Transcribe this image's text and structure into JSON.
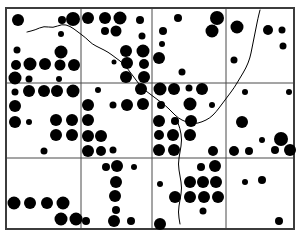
{
  "figure": {
    "width": 302,
    "height": 236,
    "background_color": "#ffffff",
    "ink_color": "#000000"
  },
  "chart_data": {
    "type": "scatter",
    "title": "",
    "subtitle": "",
    "xlabel": "",
    "ylabel": "",
    "xlim": [
      6,
      294
    ],
    "ylim": [
      8,
      229
    ],
    "grid": true,
    "legend": null,
    "marker_shape": "filled-circle",
    "marker_color": "#000000",
    "size_encoding": "marker radius encodes magnitude; radii range approximately 1.5 to 7 px",
    "grid_lines": {
      "vertical_x": [
        6,
        81,
        152,
        226,
        294
      ],
      "horizontal_y": [
        8,
        83,
        158,
        229
      ],
      "columns": 4,
      "rows": 3,
      "line_color": "#4a4a4a",
      "line_width": 1
    },
    "border": {
      "x": 6,
      "y": 8,
      "width": 288,
      "height": 221,
      "color": "#3c3c3c",
      "width_px": 2
    },
    "boundary_line": {
      "name": "river-boundary",
      "color": "#000000",
      "width": 1,
      "points": [
        [
          27,
          32
        ],
        [
          35,
          30
        ],
        [
          44,
          26
        ],
        [
          53,
          28
        ],
        [
          62,
          24
        ],
        [
          70,
          26
        ],
        [
          78,
          32
        ],
        [
          86,
          38
        ],
        [
          92,
          44
        ],
        [
          100,
          48
        ],
        [
          108,
          52
        ],
        [
          116,
          58
        ],
        [
          124,
          64
        ],
        [
          130,
          72
        ],
        [
          136,
          80
        ],
        [
          142,
          88
        ],
        [
          150,
          94
        ],
        [
          158,
          100
        ],
        [
          166,
          106
        ],
        [
          172,
          112
        ],
        [
          178,
          118
        ],
        [
          186,
          122
        ],
        [
          194,
          124
        ],
        [
          202,
          122
        ],
        [
          210,
          118
        ],
        [
          216,
          112
        ],
        [
          222,
          104
        ],
        [
          228,
          96
        ],
        [
          234,
          88
        ],
        [
          240,
          78
        ],
        [
          246,
          68
        ],
        [
          250,
          58
        ],
        [
          252,
          48
        ],
        [
          254,
          38
        ],
        [
          256,
          28
        ],
        [
          258,
          18
        ],
        [
          260,
          10
        ]
      ],
      "branch_points": [
        [
          176,
          118
        ],
        [
          180,
          128
        ],
        [
          182,
          140
        ],
        [
          180,
          152
        ],
        [
          178,
          164
        ],
        [
          180,
          176
        ],
        [
          182,
          188
        ],
        [
          180,
          200
        ],
        [
          178,
          212
        ],
        [
          180,
          224
        ]
      ]
    },
    "points": [
      {
        "x": 18,
        "y": 20,
        "r": 6
      },
      {
        "x": 62,
        "y": 20,
        "r": 4
      },
      {
        "x": 73,
        "y": 19,
        "r": 7
      },
      {
        "x": 61,
        "y": 34,
        "r": 3
      },
      {
        "x": 17,
        "y": 50,
        "r": 3.5
      },
      {
        "x": 61,
        "y": 52,
        "r": 6.5
      },
      {
        "x": 16,
        "y": 65,
        "r": 5
      },
      {
        "x": 30,
        "y": 64,
        "r": 6.5
      },
      {
        "x": 45,
        "y": 64,
        "r": 6
      },
      {
        "x": 60,
        "y": 65,
        "r": 5.5
      },
      {
        "x": 74,
        "y": 65,
        "r": 6
      },
      {
        "x": 15,
        "y": 78,
        "r": 6.5
      },
      {
        "x": 29,
        "y": 79,
        "r": 3.5
      },
      {
        "x": 59,
        "y": 79,
        "r": 3
      },
      {
        "x": 88,
        "y": 18,
        "r": 6
      },
      {
        "x": 105,
        "y": 18,
        "r": 6
      },
      {
        "x": 120,
        "y": 18,
        "r": 6.5
      },
      {
        "x": 105,
        "y": 31,
        "r": 4
      },
      {
        "x": 116,
        "y": 31,
        "r": 5.5
      },
      {
        "x": 140,
        "y": 20,
        "r": 4
      },
      {
        "x": 142,
        "y": 36,
        "r": 3.5
      },
      {
        "x": 126,
        "y": 51,
        "r": 6
      },
      {
        "x": 143,
        "y": 51,
        "r": 6.5
      },
      {
        "x": 114,
        "y": 62,
        "r": 2.5
      },
      {
        "x": 127,
        "y": 63,
        "r": 6
      },
      {
        "x": 144,
        "y": 64,
        "r": 5
      },
      {
        "x": 126,
        "y": 77,
        "r": 6
      },
      {
        "x": 144,
        "y": 77,
        "r": 6
      },
      {
        "x": 178,
        "y": 18,
        "r": 4
      },
      {
        "x": 217,
        "y": 18,
        "r": 7
      },
      {
        "x": 163,
        "y": 31,
        "r": 4
      },
      {
        "x": 212,
        "y": 31,
        "r": 6.5
      },
      {
        "x": 162,
        "y": 44,
        "r": 3
      },
      {
        "x": 159,
        "y": 58,
        "r": 6
      },
      {
        "x": 182,
        "y": 72,
        "r": 3.5
      },
      {
        "x": 237,
        "y": 27,
        "r": 6.5
      },
      {
        "x": 268,
        "y": 30,
        "r": 5
      },
      {
        "x": 282,
        "y": 30,
        "r": 3.5
      },
      {
        "x": 283,
        "y": 46,
        "r": 3.5
      },
      {
        "x": 234,
        "y": 60,
        "r": 3.5
      },
      {
        "x": 15,
        "y": 92,
        "r": 3.5
      },
      {
        "x": 29,
        "y": 91,
        "r": 6
      },
      {
        "x": 44,
        "y": 91,
        "r": 6
      },
      {
        "x": 57,
        "y": 91,
        "r": 6
      },
      {
        "x": 73,
        "y": 91,
        "r": 6.5
      },
      {
        "x": 15,
        "y": 106,
        "r": 6
      },
      {
        "x": 15,
        "y": 122,
        "r": 6
      },
      {
        "x": 29,
        "y": 122,
        "r": 3
      },
      {
        "x": 56,
        "y": 120,
        "r": 6
      },
      {
        "x": 72,
        "y": 120,
        "r": 6
      },
      {
        "x": 56,
        "y": 135,
        "r": 6
      },
      {
        "x": 72,
        "y": 135,
        "r": 6
      },
      {
        "x": 44,
        "y": 151,
        "r": 3.5
      },
      {
        "x": 98,
        "y": 90,
        "r": 3
      },
      {
        "x": 141,
        "y": 89,
        "r": 6
      },
      {
        "x": 88,
        "y": 105,
        "r": 6
      },
      {
        "x": 113,
        "y": 105,
        "r": 3.5
      },
      {
        "x": 127,
        "y": 105,
        "r": 6
      },
      {
        "x": 143,
        "y": 104,
        "r": 6
      },
      {
        "x": 88,
        "y": 120,
        "r": 6
      },
      {
        "x": 88,
        "y": 136,
        "r": 6
      },
      {
        "x": 101,
        "y": 136,
        "r": 6
      },
      {
        "x": 88,
        "y": 151,
        "r": 6
      },
      {
        "x": 101,
        "y": 151,
        "r": 5
      },
      {
        "x": 113,
        "y": 150,
        "r": 3.5
      },
      {
        "x": 160,
        "y": 89,
        "r": 6.5
      },
      {
        "x": 174,
        "y": 89,
        "r": 6
      },
      {
        "x": 189,
        "y": 88,
        "r": 3.5
      },
      {
        "x": 202,
        "y": 89,
        "r": 6
      },
      {
        "x": 161,
        "y": 105,
        "r": 4
      },
      {
        "x": 190,
        "y": 104,
        "r": 6.5
      },
      {
        "x": 212,
        "y": 105,
        "r": 3
      },
      {
        "x": 159,
        "y": 121,
        "r": 6
      },
      {
        "x": 175,
        "y": 121,
        "r": 4
      },
      {
        "x": 191,
        "y": 121,
        "r": 6
      },
      {
        "x": 159,
        "y": 135,
        "r": 5
      },
      {
        "x": 173,
        "y": 135,
        "r": 6
      },
      {
        "x": 190,
        "y": 135,
        "r": 6
      },
      {
        "x": 159,
        "y": 150,
        "r": 6
      },
      {
        "x": 174,
        "y": 150,
        "r": 6
      },
      {
        "x": 213,
        "y": 151,
        "r": 5
      },
      {
        "x": 245,
        "y": 92,
        "r": 3
      },
      {
        "x": 289,
        "y": 92,
        "r": 3
      },
      {
        "x": 242,
        "y": 122,
        "r": 6
      },
      {
        "x": 281,
        "y": 139,
        "r": 7
      },
      {
        "x": 262,
        "y": 140,
        "r": 3
      },
      {
        "x": 234,
        "y": 151,
        "r": 5
      },
      {
        "x": 249,
        "y": 151,
        "r": 4
      },
      {
        "x": 275,
        "y": 150,
        "r": 4
      },
      {
        "x": 290,
        "y": 150,
        "r": 6
      },
      {
        "x": 14,
        "y": 203,
        "r": 6.5
      },
      {
        "x": 30,
        "y": 203,
        "r": 6
      },
      {
        "x": 47,
        "y": 203,
        "r": 6
      },
      {
        "x": 63,
        "y": 203,
        "r": 6.5
      },
      {
        "x": 61,
        "y": 219,
        "r": 6.5
      },
      {
        "x": 76,
        "y": 219,
        "r": 6.5
      },
      {
        "x": 106,
        "y": 167,
        "r": 4
      },
      {
        "x": 117,
        "y": 166,
        "r": 6
      },
      {
        "x": 134,
        "y": 167,
        "r": 3
      },
      {
        "x": 116,
        "y": 182,
        "r": 6
      },
      {
        "x": 115,
        "y": 196,
        "r": 6
      },
      {
        "x": 116,
        "y": 210,
        "r": 4
      },
      {
        "x": 86,
        "y": 221,
        "r": 4
      },
      {
        "x": 114,
        "y": 221,
        "r": 6
      },
      {
        "x": 131,
        "y": 221,
        "r": 4
      },
      {
        "x": 201,
        "y": 167,
        "r": 4
      },
      {
        "x": 215,
        "y": 166,
        "r": 6
      },
      {
        "x": 190,
        "y": 182,
        "r": 6
      },
      {
        "x": 203,
        "y": 182,
        "r": 6
      },
      {
        "x": 216,
        "y": 182,
        "r": 6
      },
      {
        "x": 160,
        "y": 184,
        "r": 3
      },
      {
        "x": 175,
        "y": 197,
        "r": 6
      },
      {
        "x": 190,
        "y": 197,
        "r": 6
      },
      {
        "x": 204,
        "y": 197,
        "r": 6
      },
      {
        "x": 218,
        "y": 197,
        "r": 6
      },
      {
        "x": 203,
        "y": 211,
        "r": 3.5
      },
      {
        "x": 160,
        "y": 224,
        "r": 6
      },
      {
        "x": 245,
        "y": 182,
        "r": 3
      },
      {
        "x": 262,
        "y": 180,
        "r": 4
      },
      {
        "x": 279,
        "y": 221,
        "r": 4
      }
    ]
  }
}
